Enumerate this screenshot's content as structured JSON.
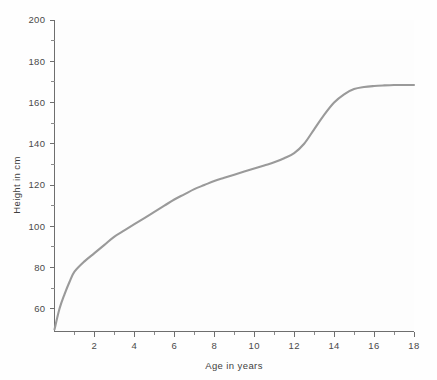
{
  "chart_data": {
    "type": "line",
    "title": "",
    "xlabel": "Age in years",
    "ylabel": "Height in cm",
    "xlim": [
      0,
      18
    ],
    "ylim": [
      49,
      200
    ],
    "grid": false,
    "legend": null,
    "line_color": "#9a9a9a",
    "axis_color": "#6e6e6e",
    "background_color": "#fdfdfd",
    "x_ticks_major": [
      2,
      4,
      6,
      8,
      10,
      12,
      14,
      16,
      18
    ],
    "x_tick_labels": [
      "2",
      "4",
      "6",
      "8",
      "10",
      "12",
      "14",
      "16",
      "18"
    ],
    "x_ticks_minor": [
      1,
      3,
      5,
      7,
      9,
      11,
      13,
      15,
      17
    ],
    "y_ticks_major": [
      60,
      80,
      100,
      120,
      140,
      160,
      180,
      200
    ],
    "y_tick_labels": [
      "60",
      "80",
      "100",
      "120",
      "140",
      "160",
      "180",
      "200"
    ],
    "y_ticks_minor": [
      70,
      90,
      110,
      130,
      150,
      170,
      190
    ],
    "series": [
      {
        "name": "Height",
        "x": [
          0,
          0.25,
          0.5,
          0.75,
          1,
          1.5,
          2,
          2.5,
          3,
          3.5,
          4,
          4.5,
          5,
          5.5,
          6,
          6.5,
          7,
          7.5,
          8,
          8.5,
          9,
          9.5,
          10,
          10.5,
          11,
          11.5,
          12,
          12.5,
          13,
          13.5,
          14,
          14.5,
          15,
          15.5,
          16,
          16.5,
          17,
          17.5,
          18
        ],
        "y": [
          50,
          60,
          67,
          73,
          78,
          83,
          87,
          91,
          95,
          98,
          101,
          104,
          107,
          110,
          113,
          115.5,
          118,
          120,
          122,
          123.5,
          125,
          126.5,
          128,
          129.5,
          131,
          133,
          135.5,
          140,
          147,
          154,
          160,
          164,
          166.5,
          167.5,
          168,
          168.3,
          168.5,
          168.5,
          168.5
        ]
      }
    ]
  }
}
